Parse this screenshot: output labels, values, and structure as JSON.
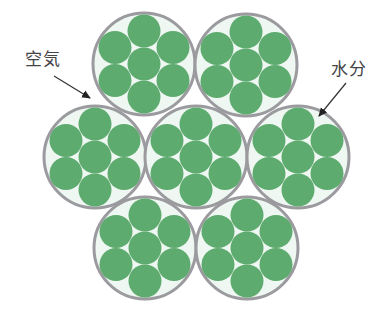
{
  "labels": {
    "air": "空気",
    "moisture": "水分"
  },
  "colors": {
    "fiber": "#5eab6f",
    "bundle_fill": "#eef7f1",
    "bundle_outline": "#9b9a9f",
    "text": "#444447",
    "arrow": "#333333"
  },
  "bundles": [
    {
      "cx": 144,
      "cy": 64
    },
    {
      "cx": 246,
      "cy": 65
    },
    {
      "cx": 95,
      "cy": 157
    },
    {
      "cx": 196,
      "cy": 157
    },
    {
      "cx": 298,
      "cy": 157
    },
    {
      "cx": 145,
      "cy": 248
    },
    {
      "cx": 247,
      "cy": 248
    }
  ],
  "bundle_radius": 51,
  "fiber_radius": 16.5,
  "fiber_offsets": [
    [
      0,
      0
    ],
    [
      0,
      -33
    ],
    [
      0,
      33
    ],
    [
      -29,
      -16.5
    ],
    [
      29,
      -16.5
    ],
    [
      -29,
      16.5
    ],
    [
      29,
      16.5
    ]
  ]
}
